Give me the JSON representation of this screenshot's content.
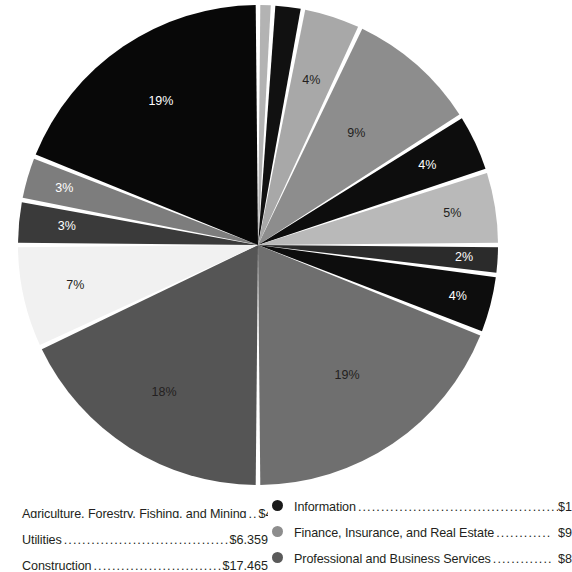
{
  "chart_data": {
    "type": "pie",
    "title": "",
    "subtitle": "",
    "xlabel": "",
    "ylabel": "",
    "legend_position": "bottom",
    "grid": false,
    "label_suffix": "%",
    "center": {
      "cx": 258,
      "cy": 245,
      "r": 240
    },
    "start_angle_deg": -90,
    "slice_gap_deg": 1.1,
    "categories": [
      "slice-1",
      "slice-2",
      "slice-3",
      "slice-4",
      "slice-5",
      "slice-6",
      "slice-7",
      "slice-8",
      "slice-9",
      "slice-10",
      "slice-11",
      "slice-12",
      "slice-13",
      "slice-14"
    ],
    "values": [
      1,
      2,
      4,
      9,
      4,
      5,
      2,
      4,
      19,
      18,
      7,
      3,
      3,
      19
    ],
    "labels": [
      "",
      "",
      "4%",
      "9%",
      "4%",
      "5%",
      "2%",
      "4%",
      "19%",
      "18%",
      "7%",
      "3%",
      "3%",
      "19%"
    ],
    "colors": [
      "#b3b3b3",
      "#111111",
      "#a8a8a8",
      "#8d8d8d",
      "#0d0d0d",
      "#b9b9b9",
      "#2b2b2b",
      "#0d0d0d",
      "#6f6f6f",
      "#555555",
      "#f1f1f1",
      "#3a3a3a",
      "#7d7d7d",
      "#080808"
    ],
    "label_colors": [
      "#231f20",
      "#ffffff",
      "#231f20",
      "#231f20",
      "#ffffff",
      "#231f20",
      "#ffffff",
      "#ffffff",
      "#231f20",
      "#231f20",
      "#231f20",
      "#ffffff",
      "#ffffff",
      "#ffffff"
    ],
    "label_radius_frac": [
      0.7,
      0.7,
      0.72,
      0.62,
      0.78,
      0.82,
      0.86,
      0.86,
      0.66,
      0.73,
      0.78,
      0.8,
      0.84,
      0.72
    ],
    "separator_color": "#ffffff",
    "separator_width": 3
  },
  "legend": {
    "left_column": [
      {
        "name": "Agriculture, Forestry, Fishing, and Mining",
        "dots": "......",
        "value": "$4,481",
        "swatch_visible": false,
        "color": "#b9b9b9"
      },
      {
        "name": "Utilities",
        "dots": ".........................................",
        "value": "$6,359",
        "swatch_visible": false,
        "color": "#8d8d8d"
      },
      {
        "name": "Construction",
        "dots": "..................................",
        "value": "$17,465",
        "swatch_visible": false,
        "color": "#555555"
      }
    ],
    "right_column": [
      {
        "name": "Information",
        "dots": "..................................................",
        "value": "$1",
        "swatch_visible": true,
        "color": "#1a1a1a"
      },
      {
        "name": "Finance, Insurance, and Real Estate",
        "dots": "............",
        "value": "$9",
        "swatch_visible": true,
        "color": "#8d8d8d"
      },
      {
        "name": "Professional and Business Services",
        "dots": ".............",
        "value": "$8",
        "swatch_visible": true,
        "color": "#5a5a5a"
      }
    ]
  }
}
